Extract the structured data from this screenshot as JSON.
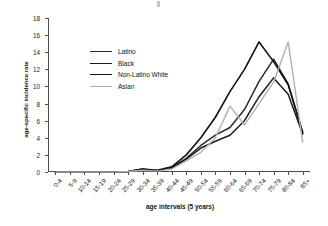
{
  "chart_data": {
    "type": "line",
    "title": "",
    "xlabel": "age intervals (5 years)",
    "ylabel": "age-specific incidence rate",
    "categories": [
      "0-4",
      "5-9",
      "10-14",
      "15-19",
      "20-24",
      "25-29",
      "30-34",
      "35-39",
      "40-44",
      "45-49",
      "50-54",
      "55-59",
      "60-64",
      "65-69",
      "70-74",
      "75-79",
      "80-84",
      "85+"
    ],
    "ylim": [
      0,
      18
    ],
    "yticks": [
      0,
      2,
      4,
      6,
      8,
      10,
      12,
      14,
      16,
      18
    ],
    "grid": false,
    "legend_position": "upper-left-inside",
    "series": [
      {
        "name": "Latino",
        "color": "#2b2b2b",
        "values": [
          0,
          0,
          0,
          0,
          0,
          0.05,
          0.35,
          0.1,
          0.5,
          1.6,
          3.1,
          4.3,
          5.2,
          7.3,
          10.6,
          13.2,
          10.3,
          4.6
        ]
      },
      {
        "name": "Black",
        "color": "#1c1c1c",
        "values": [
          0,
          0,
          0,
          0,
          0,
          0.05,
          0.3,
          0.15,
          0.45,
          1.5,
          2.8,
          3.6,
          4.3,
          6.0,
          8.8,
          11.0,
          9.1,
          4.4
        ]
      },
      {
        "name": "Non-Latino White",
        "color": "#111111",
        "values": [
          0,
          0,
          0,
          0,
          0,
          0.05,
          0.35,
          0.2,
          0.6,
          2.0,
          4.0,
          6.4,
          9.4,
          12.0,
          15.2,
          12.9,
          10.2,
          4.6
        ]
      },
      {
        "name": "Asian",
        "color": "#b0b0b0",
        "values": [
          0,
          0,
          0,
          0,
          0,
          0.05,
          0.2,
          0.1,
          0.35,
          1.3,
          2.3,
          4.0,
          7.7,
          5.5,
          8.0,
          10.5,
          15.2,
          3.5
        ]
      }
    ]
  }
}
